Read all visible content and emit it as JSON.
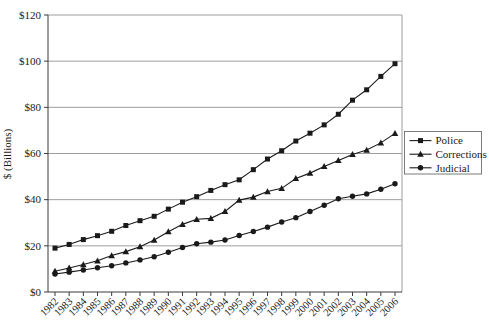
{
  "chart_data": {
    "type": "line",
    "title": "",
    "xlabel": "",
    "ylabel": "$ (Billions)",
    "categories": [
      "1982",
      "1983",
      "1984",
      "1985",
      "1986",
      "1987",
      "1988",
      "1989",
      "1990",
      "1991",
      "1992",
      "1993",
      "1994",
      "1995",
      "1996",
      "1997",
      "1998",
      "1999",
      "2000",
      "2001",
      "2002",
      "2003",
      "2004",
      "2005",
      "2006"
    ],
    "y_ticks": [
      0,
      20,
      40,
      60,
      80,
      100,
      120
    ],
    "y_tick_labels": [
      "$0",
      "$20",
      "$40",
      "$60",
      "$80",
      "$100",
      "$120"
    ],
    "ylim": [
      0,
      120
    ],
    "grid": "horizontal",
    "legend_position": "middle-right",
    "line_color": "#1a1a1a",
    "grid_color": "#9d9d9d",
    "axis_color": "#3a3a3a",
    "legend_border_color": "#7a7a7a",
    "series": [
      {
        "name": "Police",
        "marker": "square",
        "values": [
          19.0,
          20.6,
          22.7,
          24.4,
          26.3,
          28.8,
          30.9,
          32.8,
          35.9,
          38.9,
          41.3,
          44.0,
          46.5,
          48.6,
          53.0,
          57.6,
          61.2,
          65.4,
          68.8,
          72.4,
          77.0,
          83.1,
          87.6,
          93.4,
          98.9
        ]
      },
      {
        "name": "Corrections",
        "marker": "triangle",
        "values": [
          9.0,
          10.4,
          11.9,
          13.5,
          15.8,
          17.5,
          19.6,
          22.5,
          26.1,
          29.3,
          31.5,
          31.9,
          34.9,
          39.8,
          41.1,
          43.5,
          44.9,
          49.2,
          51.5,
          54.4,
          57.0,
          59.6,
          61.5,
          64.6,
          68.7
        ]
      },
      {
        "name": "Judicial",
        "marker": "circle",
        "values": [
          7.8,
          8.6,
          9.5,
          10.5,
          11.4,
          12.6,
          13.9,
          15.3,
          17.2,
          19.3,
          20.9,
          21.6,
          22.5,
          24.5,
          26.2,
          28.1,
          30.3,
          32.2,
          34.9,
          37.6,
          40.4,
          41.5,
          42.5,
          44.5,
          46.9
        ]
      }
    ]
  }
}
